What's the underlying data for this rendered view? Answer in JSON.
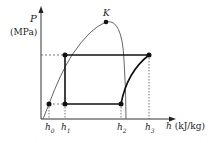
{
  "diagram": {
    "type": "pressure-enthalpy (P-h) diagram",
    "y_axis": {
      "symbol": "P",
      "unit": "(MPa)"
    },
    "x_axis": {
      "symbol": "h",
      "unit": "(kJ/kg)"
    },
    "critical_point": "K",
    "ticks": [
      {
        "base": "h",
        "sub": "0"
      },
      {
        "base": "h",
        "sub": "1"
      },
      {
        "base": "h",
        "sub": "2"
      },
      {
        "base": "h",
        "sub": "3"
      }
    ],
    "cycle_points": [
      {
        "name": "high-left",
        "at": "h1, high P"
      },
      {
        "name": "high-right",
        "at": "h3, high P"
      },
      {
        "name": "low-right",
        "at": "h2, low P"
      },
      {
        "name": "low-left",
        "at": "h1, low P"
      },
      {
        "name": "h0-point",
        "at": "h0, low P on saturated liquid line"
      }
    ],
    "colors": {
      "line": "#222222",
      "dome": "#666666"
    }
  }
}
